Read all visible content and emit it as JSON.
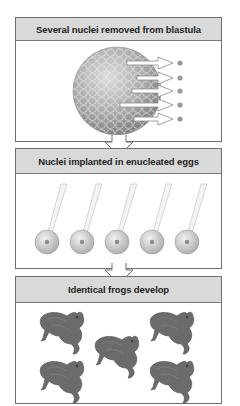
{
  "diagram": {
    "steps": [
      {
        "label": "Several nuclei removed from blastula",
        "illustration": "blastula-with-nuclei-extraction",
        "nuclei_count": 5
      },
      {
        "label": "Nuclei implanted in enucleated eggs",
        "illustration": "pipettes-into-eggs",
        "egg_count": 5
      },
      {
        "label": "Identical frogs develop",
        "illustration": "cloned-frogs",
        "frog_count": 5
      }
    ],
    "connectors": [
      "down-arrow",
      "down-arrow"
    ],
    "colors": {
      "header_bg": "#d9d9d9",
      "border": "#6e6e6e",
      "text": "#1e1e1e",
      "nucleus": "#9a9a9a",
      "frog": "#6b6b6b"
    }
  }
}
